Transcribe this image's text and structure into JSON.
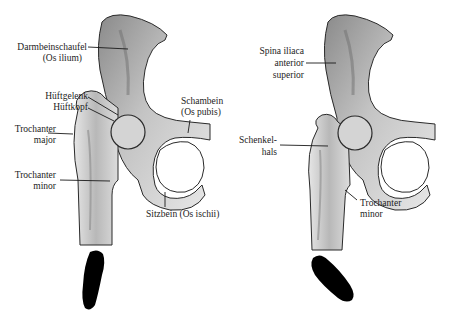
{
  "left_panel": {
    "labels": {
      "darmbeinschaufel": "Darmbeinschaufel",
      "os_ilium": "(Os ilium)",
      "hueftgelenk": "Hüftgelenk",
      "hueftkopf": "Hüftkopf",
      "trochanter_major_1": "Trochanter",
      "trochanter_major_2": "major",
      "trochanter_minor_1": "Trochanter",
      "trochanter_minor_2": "minor",
      "schambein": "Schambein",
      "os_pubis": "(Os pubis)",
      "sitzbein": "Sitzbein (Os ischii)"
    },
    "footprint_orientation": "straight"
  },
  "right_panel": {
    "labels": {
      "spina_1": "Spina iliaca",
      "spina_2": "anterior",
      "spina_3": "superior",
      "schenkelhals_1": "Schenkel-",
      "schenkelhals_2": "hals",
      "trochanter_minor_1": "Trochanter",
      "trochanter_minor_2": "minor"
    },
    "footprint_orientation": "rotated-outward"
  },
  "colors": {
    "bone_fill": "#d9d9d9",
    "bone_shade": "#9a9a9a",
    "outline": "#2a2a2a",
    "footprint": "#000000"
  }
}
